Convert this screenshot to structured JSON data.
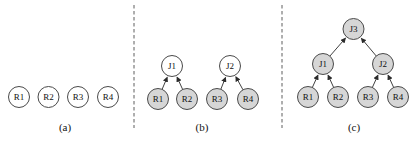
{
  "figure": {
    "width": 413,
    "height": 144,
    "background": "#ffffff",
    "colors": {
      "node_fill_plain": "#ffffff",
      "node_fill_shaded": "#d6d6d6",
      "node_stroke": "#4a4a4a",
      "edge_stroke": "#2b2b2b",
      "divider_stroke": "#5f5f5f",
      "label_color": "#111111"
    },
    "node_radius": 10.5,
    "dividers": [
      {
        "x": 134,
        "y1": 5,
        "y2": 128
      },
      {
        "x": 282,
        "y1": 5,
        "y2": 128
      }
    ],
    "panels": [
      {
        "name": "a",
        "caption": {
          "text": "(a)",
          "x": 65,
          "y": 131
        },
        "nodes": [
          {
            "id": "a-R1",
            "label": "R1",
            "x": 19,
            "y": 97,
            "shaded": false
          },
          {
            "id": "a-R2",
            "label": "R2",
            "x": 48.5,
            "y": 97,
            "shaded": false
          },
          {
            "id": "a-R3",
            "label": "R3",
            "x": 78,
            "y": 97,
            "shaded": false
          },
          {
            "id": "a-R4",
            "label": "R4",
            "x": 108,
            "y": 97,
            "shaded": false
          }
        ],
        "edges": []
      },
      {
        "name": "b",
        "caption": {
          "text": "(b)",
          "x": 202,
          "y": 131
        },
        "nodes": [
          {
            "id": "b-J1",
            "label": "J1",
            "x": 172,
            "y": 66,
            "shaded": false
          },
          {
            "id": "b-J2",
            "label": "J2",
            "x": 230,
            "y": 66,
            "shaded": false
          },
          {
            "id": "b-R1",
            "label": "R1",
            "x": 158,
            "y": 99,
            "shaded": true
          },
          {
            "id": "b-R2",
            "label": "R2",
            "x": 187,
            "y": 99,
            "shaded": true
          },
          {
            "id": "b-R3",
            "label": "R3",
            "x": 217,
            "y": 99,
            "shaded": true
          },
          {
            "id": "b-R4",
            "label": "R4",
            "x": 248,
            "y": 99,
            "shaded": true
          }
        ],
        "edges": [
          {
            "from": "b-R1",
            "to": "b-J1"
          },
          {
            "from": "b-R2",
            "to": "b-J1"
          },
          {
            "from": "b-R3",
            "to": "b-J2"
          },
          {
            "from": "b-R4",
            "to": "b-J2"
          }
        ]
      },
      {
        "name": "c",
        "caption": {
          "text": "(c)",
          "x": 354,
          "y": 131
        },
        "nodes": [
          {
            "id": "c-J3",
            "label": "J3",
            "x": 353.5,
            "y": 29,
            "shaded": true
          },
          {
            "id": "c-J1",
            "label": "J1",
            "x": 323,
            "y": 64,
            "shaded": true
          },
          {
            "id": "c-J2",
            "label": "J2",
            "x": 383,
            "y": 64,
            "shaded": true
          },
          {
            "id": "c-R1",
            "label": "R1",
            "x": 308,
            "y": 97,
            "shaded": true
          },
          {
            "id": "c-R2",
            "label": "R2",
            "x": 338,
            "y": 97,
            "shaded": true
          },
          {
            "id": "c-R3",
            "label": "R3",
            "x": 368,
            "y": 97,
            "shaded": true
          },
          {
            "id": "c-R4",
            "label": "R4",
            "x": 398,
            "y": 97,
            "shaded": true
          }
        ],
        "edges": [
          {
            "from": "c-R1",
            "to": "c-J1"
          },
          {
            "from": "c-R2",
            "to": "c-J1"
          },
          {
            "from": "c-R3",
            "to": "c-J2"
          },
          {
            "from": "c-R4",
            "to": "c-J2"
          },
          {
            "from": "c-J1",
            "to": "c-J3"
          },
          {
            "from": "c-J2",
            "to": "c-J3"
          }
        ]
      }
    ]
  }
}
